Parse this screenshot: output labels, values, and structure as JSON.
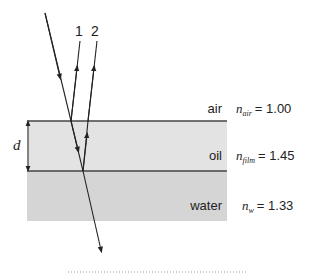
{
  "rays": {
    "label_1": "1",
    "label_2": "2"
  },
  "thickness_label": "d",
  "layers": [
    {
      "name": "air",
      "n_symbol": "n",
      "n_sub": "air",
      "n_value": "= 1.00"
    },
    {
      "name": "oil",
      "n_symbol": "n",
      "n_sub": "film",
      "n_value": "= 1.45"
    },
    {
      "name": "water",
      "n_symbol": "n",
      "n_sub": "w",
      "n_value": "= 1.33"
    }
  ],
  "colors": {
    "oil_fill": "#e3e3e3",
    "water_fill": "#d5d5d5",
    "line": "#222222",
    "interface": "#444444"
  }
}
